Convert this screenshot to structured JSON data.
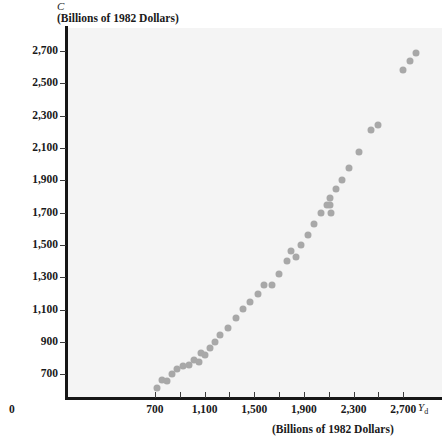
{
  "figure": {
    "background_color": "#ffffff",
    "plot_background_color": "#f4f4f4",
    "axis_color": "#161616",
    "point_color": "#a8a8a8"
  },
  "labels": {
    "y_symbol": "C",
    "y_units": "(Billions of 1982 Dollars)",
    "x_symbol": "Y",
    "x_symbol_sub": "d",
    "x_units": "(Billions of 1982 Dollars)",
    "origin": "0"
  },
  "chart_data": {
    "type": "scatter",
    "title": "",
    "xlabel": "Yd (Billions of 1982 Dollars)",
    "ylabel": "C (Billions of 1982 Dollars)",
    "xlim": [
      0,
      2980
    ],
    "ylim": [
      560,
      2830
    ],
    "grid": false,
    "legend": null,
    "x_ticks": [
      0,
      700,
      1100,
      1500,
      1900,
      2300,
      2700
    ],
    "x_tick_labels": [
      "0",
      "700",
      "1,100",
      "1,500",
      "1,900",
      "2,300",
      "2,700"
    ],
    "x_minor_ticks": [
      900,
      1300,
      1700,
      2100,
      2500
    ],
    "y_ticks": [
      700,
      900,
      1100,
      1300,
      1500,
      1700,
      1900,
      2100,
      2300,
      2500,
      2700
    ],
    "y_tick_labels": [
      "700",
      "900",
      "1,100",
      "1,300",
      "1,500",
      "1,700",
      "1,900",
      "2,100",
      "2,300",
      "2,500",
      "2,700"
    ],
    "points": [
      {
        "x": 718,
        "y": 618
      },
      {
        "x": 760,
        "y": 663
      },
      {
        "x": 800,
        "y": 660
      },
      {
        "x": 840,
        "y": 700
      },
      {
        "x": 878,
        "y": 735
      },
      {
        "x": 928,
        "y": 752
      },
      {
        "x": 975,
        "y": 757
      },
      {
        "x": 1016,
        "y": 790
      },
      {
        "x": 1052,
        "y": 775
      },
      {
        "x": 1070,
        "y": 830
      },
      {
        "x": 1106,
        "y": 822
      },
      {
        "x": 1145,
        "y": 860
      },
      {
        "x": 1186,
        "y": 900
      },
      {
        "x": 1228,
        "y": 945
      },
      {
        "x": 1290,
        "y": 985
      },
      {
        "x": 1352,
        "y": 1050
      },
      {
        "x": 1408,
        "y": 1105
      },
      {
        "x": 1468,
        "y": 1150
      },
      {
        "x": 1530,
        "y": 1195
      },
      {
        "x": 1580,
        "y": 1255
      },
      {
        "x": 1640,
        "y": 1255
      },
      {
        "x": 1700,
        "y": 1320
      },
      {
        "x": 1760,
        "y": 1400
      },
      {
        "x": 1800,
        "y": 1460
      },
      {
        "x": 1835,
        "y": 1425
      },
      {
        "x": 1880,
        "y": 1500
      },
      {
        "x": 1930,
        "y": 1560
      },
      {
        "x": 1985,
        "y": 1630
      },
      {
        "x": 2040,
        "y": 1700
      },
      {
        "x": 2085,
        "y": 1745
      },
      {
        "x": 2110,
        "y": 1745
      },
      {
        "x": 2112,
        "y": 1790
      },
      {
        "x": 2120,
        "y": 1700
      },
      {
        "x": 2160,
        "y": 1845
      },
      {
        "x": 2205,
        "y": 1905
      },
      {
        "x": 2262,
        "y": 1975
      },
      {
        "x": 2345,
        "y": 2075
      },
      {
        "x": 2440,
        "y": 2210
      },
      {
        "x": 2495,
        "y": 2240
      },
      {
        "x": 2700,
        "y": 2585
      },
      {
        "x": 2755,
        "y": 2640
      },
      {
        "x": 2800,
        "y": 2690
      }
    ]
  }
}
